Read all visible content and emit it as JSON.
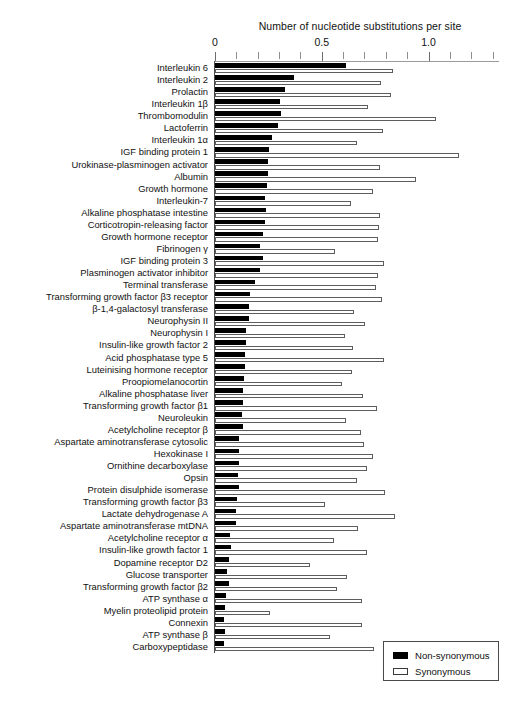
{
  "chart_data": {
    "type": "bar",
    "orientation": "horizontal",
    "title": "",
    "xlabel": "Number of nucleotide substitutions per site",
    "ylabel": "",
    "xlim": [
      0,
      1.33
    ],
    "xticks_major": [
      0,
      0.5,
      1.0
    ],
    "xtick_labels": [
      "0",
      "0.5",
      "1.0"
    ],
    "xticks_minor_step": 0.1,
    "grid": false,
    "legend_position": "bottom-right",
    "series": [
      {
        "name": "Non-synonymous",
        "color": "#000000"
      },
      {
        "name": "Synonymous",
        "color": "#ffffff"
      }
    ],
    "categories": [
      "Interleukin 6",
      "Interleukin 2",
      "Prolactin",
      "Interleukin 1β",
      "Thrombomodulin",
      "Lactoferrin",
      "Interleukin 1α",
      "IGF binding protein 1",
      "Urokinase-plasminogen activator",
      "Albumin",
      "Growth hormone",
      "Interleukin-7",
      "Alkaline phosphatase intestine",
      "Corticotropin-releasing factor",
      "Growth hormone receptor",
      "Fibrinogen γ",
      "IGF binding protein 3",
      "Plasminogen activator inhibitor",
      "Terminal transferase",
      "Transforming growth factor β3 receptor",
      "β-1,4-galactosyl transferase",
      "Neurophysin II",
      "Neurophysin I",
      "Insulin-like growth factor 2",
      "Acid phosphatase type 5",
      "Luteinising hormone receptor",
      "Proopiomelanocortin",
      "Alkaline phosphatase liver",
      "Transforming growth factor β1",
      "Neuroleukin",
      "Acetylcholine receptor β",
      "Aspartate aminotransferase cytosolic",
      "Hexokinase I",
      "Ornithine decarboxylase",
      "Opsin",
      "Protein disulphide isomerase",
      "Transforming growth factor β3",
      "Lactate dehydrogenase A",
      "Aspartate aminotransferase mtDNA",
      "Acetylcholine receptor α",
      "Insulin-like growth factor 1",
      "Dopamine receptor D2",
      "Glucose transporter",
      "Transforming growth factor β2",
      "ATP synthase α",
      "Myelin proteolipid protein",
      "Connexin",
      "ATP synthase β",
      "Carboxypeptidase"
    ],
    "non_synonymous": [
      0.615,
      0.372,
      0.327,
      0.306,
      0.31,
      0.297,
      0.266,
      0.252,
      0.248,
      0.249,
      0.242,
      0.232,
      0.241,
      0.234,
      0.225,
      0.21,
      0.223,
      0.211,
      0.187,
      0.165,
      0.158,
      0.158,
      0.143,
      0.147,
      0.139,
      0.141,
      0.135,
      0.132,
      0.132,
      0.126,
      0.129,
      0.112,
      0.112,
      0.112,
      0.106,
      0.112,
      0.105,
      0.1,
      0.1,
      0.072,
      0.075,
      0.064,
      0.055,
      0.064,
      0.051,
      0.046,
      0.043,
      0.045,
      0.043
    ],
    "synonymous": [
      0.834,
      0.776,
      0.825,
      0.716,
      1.035,
      0.787,
      0.663,
      1.143,
      0.772,
      0.943,
      0.741,
      0.638,
      0.775,
      0.766,
      0.763,
      0.561,
      0.793,
      0.764,
      0.755,
      0.783,
      0.653,
      0.704,
      0.61,
      0.646,
      0.79,
      0.642,
      0.596,
      0.693,
      0.757,
      0.615,
      0.684,
      0.7,
      0.741,
      0.713,
      0.667,
      0.795,
      0.513,
      0.845,
      0.672,
      0.558,
      0.712,
      0.446,
      0.618,
      0.57,
      0.69,
      0.257,
      0.69,
      0.538,
      0.745
    ]
  },
  "legend": {
    "items": [
      {
        "label": "Non-synonymous"
      },
      {
        "label": "Synonymous"
      }
    ]
  }
}
